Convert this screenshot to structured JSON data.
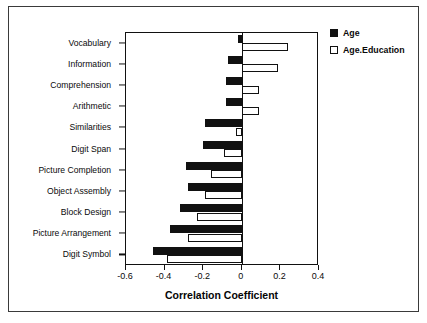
{
  "chart_data": {
    "type": "bar",
    "orientation": "horizontal",
    "title": "",
    "xlabel": "Correlation Coefficient",
    "ylabel": "",
    "xlim": [
      -0.6,
      0.4
    ],
    "xticks": [
      -0.6,
      -0.4,
      -0.2,
      0,
      0.2,
      0.4
    ],
    "xticklabels": [
      "-0.6",
      "-0.4",
      "-0.2",
      "0",
      "0.2",
      "0.4"
    ],
    "grid": false,
    "legend_position": "outside right top",
    "categories": [
      "Vocabulary",
      "Information",
      "Comprehension",
      "Arithmetic",
      "Similarities",
      "Digit Span",
      "Picture Completion",
      "Object Assembly",
      "Block Design",
      "Picture Arrangement",
      "Digit Symbol"
    ],
    "series": [
      {
        "name": "Age",
        "color": "#111111",
        "style": "filled",
        "values": [
          -0.02,
          -0.07,
          -0.08,
          -0.08,
          -0.19,
          -0.2,
          -0.29,
          -0.28,
          -0.32,
          -0.37,
          -0.46
        ]
      },
      {
        "name": "Age.Education",
        "color": "#ffffff",
        "style": "hollow",
        "values": [
          0.24,
          0.19,
          0.09,
          0.09,
          -0.03,
          -0.09,
          -0.16,
          -0.19,
          -0.23,
          -0.28,
          -0.39
        ]
      }
    ]
  },
  "legend": {
    "items": [
      {
        "label": "Age",
        "style": "filled"
      },
      {
        "label": "Age.Education",
        "style": "hollow"
      }
    ]
  }
}
